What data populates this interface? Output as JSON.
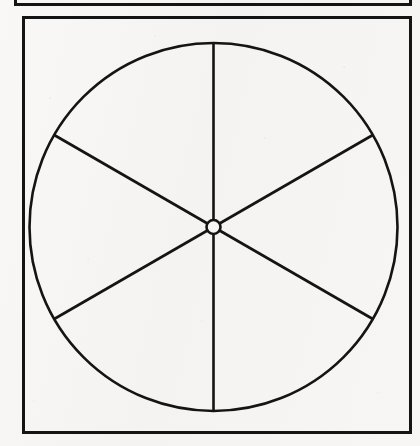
{
  "page": {
    "width": 420,
    "height": 446,
    "background_color": "#f6f5f3",
    "ink_color": "#141414"
  },
  "upper_frame": {
    "label": "partial-frame-box",
    "x": 14,
    "y": -40,
    "width": 398,
    "height": 46,
    "stroke_width": 3,
    "stroke_color": "#141414"
  },
  "main_frame": {
    "label": "frame-box",
    "x": 22,
    "y": 16,
    "width": 390,
    "height": 418,
    "stroke_width": 3,
    "stroke_color": "#141414"
  },
  "diagram": {
    "name": "six-sector-circle",
    "center_x": 213.5,
    "center_y": 227,
    "outer_radius": 184,
    "outer_stroke_width": 2.6,
    "hub_radius": 7,
    "hub_stroke_width": 2.6,
    "hub_fill": "#f6f5f3",
    "stroke_color": "#141414",
    "spoke_stroke_width": 2.6,
    "sector_count": 6,
    "sector_angle_degrees": 60,
    "spokes": [
      {
        "id": "spoke-up",
        "angle_degrees": 90,
        "end_x": 213.5,
        "end_y": 43
      },
      {
        "id": "spoke-upper-right",
        "angle_degrees": 30,
        "end_x": 372.8,
        "end_y": 135
      },
      {
        "id": "spoke-lower-right",
        "angle_degrees": 330,
        "end_x": 372.8,
        "end_y": 319
      },
      {
        "id": "spoke-down",
        "angle_degrees": 270,
        "end_x": 213.5,
        "end_y": 411
      },
      {
        "id": "spoke-lower-left",
        "angle_degrees": 210,
        "end_x": 54.2,
        "end_y": 319
      },
      {
        "id": "spoke-upper-left",
        "angle_degrees": 150,
        "end_x": 54.2,
        "end_y": 135
      }
    ]
  },
  "chart_data": {
    "type": "pie",
    "title": "",
    "subtitle": "",
    "xlabel": "",
    "ylabel": "",
    "legend": [],
    "annotations": [],
    "grid": false,
    "categories": [
      "Sector 1",
      "Sector 2",
      "Sector 3",
      "Sector 4",
      "Sector 5",
      "Sector 6"
    ],
    "values": [
      60,
      60,
      60,
      60,
      60,
      60
    ],
    "value_unit": "degrees",
    "percentages": [
      16.7,
      16.7,
      16.7,
      16.7,
      16.7,
      16.7
    ],
    "slice_fill": "none",
    "slice_stroke": "#141414",
    "total_degrees": 360
  }
}
